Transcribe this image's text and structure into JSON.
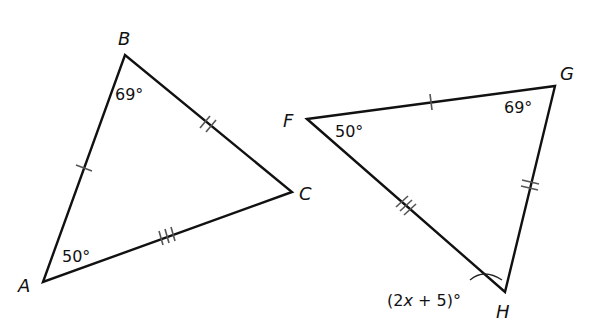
{
  "diagram": {
    "type": "congruent-triangles",
    "triangles": [
      {
        "name": "ABC",
        "vertices": {
          "A": {
            "label": "A",
            "x": 43,
            "y": 282
          },
          "B": {
            "label": "B",
            "x": 125,
            "y": 55
          },
          "C": {
            "label": "C",
            "x": 292,
            "y": 192
          }
        },
        "angles": {
          "A": "50°",
          "B": "69°"
        },
        "side_marks": {
          "AB": 1,
          "BC": 2,
          "AC": 3
        }
      },
      {
        "name": "FGH",
        "vertices": {
          "F": {
            "label": "F",
            "x": 307,
            "y": 119
          },
          "G": {
            "label": "G",
            "x": 555,
            "y": 86
          },
          "H": {
            "label": "H",
            "x": 505,
            "y": 292
          }
        },
        "angles": {
          "F": "50°",
          "G": "69°",
          "H": "(2x + 5)°"
        },
        "side_marks": {
          "FG": 1,
          "GH": 2,
          "FH": 3
        }
      }
    ]
  },
  "labels": {
    "A": "A",
    "B": "B",
    "C": "C",
    "F": "F",
    "G": "G",
    "H": "H",
    "angle_A": "50°",
    "angle_B": "69°",
    "angle_F": "50°",
    "angle_G": "69°",
    "angle_H_pre": "(2",
    "angle_H_var": "x",
    "angle_H_post": " + 5)°"
  }
}
